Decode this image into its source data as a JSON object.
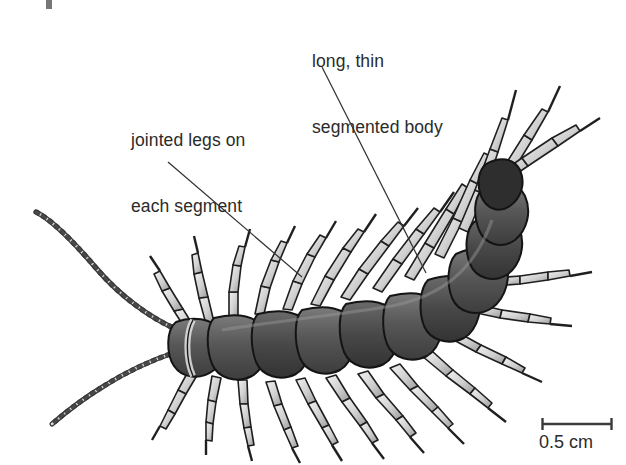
{
  "figure": {
    "background_color": "#ffffff",
    "ink_color": "#2b2b2b",
    "width": 626,
    "height": 465
  },
  "labels": [
    {
      "id": "body",
      "text": "long, thin\nsegmented body",
      "line1": "long, thin",
      "line2": "segmented body",
      "leader_from": [
        322,
        67
      ],
      "leader_to": [
        426,
        273
      ]
    },
    {
      "id": "legs",
      "text": "jointed legs on\neach segment",
      "line1": "jointed legs on",
      "line2": "each segment",
      "leader_from": [
        168,
        162
      ],
      "leader_to": [
        302,
        277
      ]
    }
  ],
  "scale_bar": {
    "caption": "0.5 cm",
    "value": "0.5",
    "unit": "cm",
    "bar_left_x": 542,
    "bar_right_x": 612,
    "bar_y": 424
  },
  "organism": {
    "name": "centipede",
    "body_fill": "#4f4f4f",
    "body_shade": "#6d6d6d",
    "body_highlight": "#c9c9c9",
    "leg_fill": "#d8d8d8",
    "outline": "#1c1c1c",
    "segment_count": 15,
    "antenna_count": 2,
    "features": [
      "long, thin segmented body",
      "jointed legs on each segment",
      "two long segmented antennae",
      "curved posterior with elongated legs"
    ]
  }
}
